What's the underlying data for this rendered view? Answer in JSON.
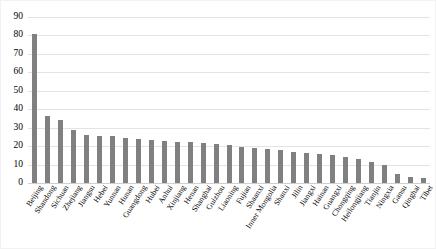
{
  "chart_data": {
    "type": "bar",
    "title": "",
    "subtitle": "",
    "xlabel": "",
    "ylabel": "",
    "ylim": [
      0,
      90
    ],
    "ytick_step": 10,
    "yticks": [
      "90",
      "80",
      "70",
      "60",
      "50",
      "40",
      "30",
      "20",
      "10",
      "0"
    ],
    "grid": true,
    "legend": false,
    "legend_position": "none",
    "bar_color": "#808080",
    "gridline_color": "#e3e3e3",
    "categories": [
      "Beijing",
      "Shandong",
      "Sichuan",
      "Zhejiang",
      "Jiangsu",
      "Hebei",
      "Yunnan",
      "Hunan",
      "Guangdong",
      "Hubei",
      "Anhui",
      "Xinjiang",
      "Henan",
      "Shanghai",
      "Guizhou",
      "Liaoning",
      "Fujian",
      "Shaanxi",
      "Inner Mongolia",
      "Shanxi",
      "Jilin",
      "Jiangxi",
      "Hainan",
      "Guangxi",
      "Chongqing",
      "Heilongjiang",
      "Tianjin",
      "Ningxia",
      "Gansu",
      "Qinghai",
      "Tibet"
    ],
    "values": [
      81,
      36.5,
      34,
      28.5,
      26,
      25.5,
      25.5,
      24.5,
      24,
      23.5,
      23,
      22.5,
      22,
      21.5,
      21,
      20.5,
      19.5,
      19,
      18.5,
      18,
      17,
      16.5,
      16,
      15,
      14,
      13,
      11.5,
      10,
      5,
      3.5,
      2.5
    ]
  }
}
